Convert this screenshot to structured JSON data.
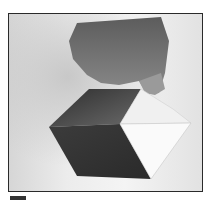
{
  "photo": {
    "subject": "hand holding a folded paper cube illusion",
    "colors": {
      "frame_border": "#2a2a2a",
      "background_light": "#f4f4f4",
      "background_shadow": "#d6d6d6",
      "dark_face_top": "#4a4a4a",
      "dark_face_bottom": "#3a3a3a",
      "light_face": "#f8f8f8",
      "skin": "#7a7a7a"
    }
  }
}
